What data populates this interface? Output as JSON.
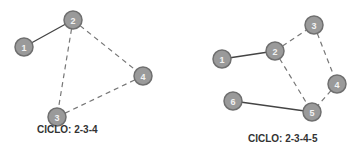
{
  "graphs": [
    {
      "caption": "CICLO: 2-3-4",
      "nodes": [
        {
          "id": "1",
          "label": "1"
        },
        {
          "id": "2",
          "label": "2"
        },
        {
          "id": "3",
          "label": "3"
        },
        {
          "id": "4",
          "label": "4"
        }
      ],
      "edges": [
        {
          "from": "1",
          "to": "2",
          "style": "solid"
        },
        {
          "from": "2",
          "to": "3",
          "style": "dashed"
        },
        {
          "from": "2",
          "to": "4",
          "style": "dashed"
        },
        {
          "from": "3",
          "to": "4",
          "style": "dashed"
        }
      ]
    },
    {
      "caption": "CICLO: 2-3-4-5",
      "nodes": [
        {
          "id": "1",
          "label": "1"
        },
        {
          "id": "2",
          "label": "2"
        },
        {
          "id": "3",
          "label": "3"
        },
        {
          "id": "4",
          "label": "4"
        },
        {
          "id": "5",
          "label": "5"
        },
        {
          "id": "6",
          "label": "6"
        }
      ],
      "edges": [
        {
          "from": "1",
          "to": "2",
          "style": "solid"
        },
        {
          "from": "2",
          "to": "3",
          "style": "dashed"
        },
        {
          "from": "3",
          "to": "4",
          "style": "dashed"
        },
        {
          "from": "4",
          "to": "5",
          "style": "dashed"
        },
        {
          "from": "2",
          "to": "5",
          "style": "dashed"
        },
        {
          "from": "6",
          "to": "5",
          "style": "solid"
        }
      ]
    }
  ]
}
